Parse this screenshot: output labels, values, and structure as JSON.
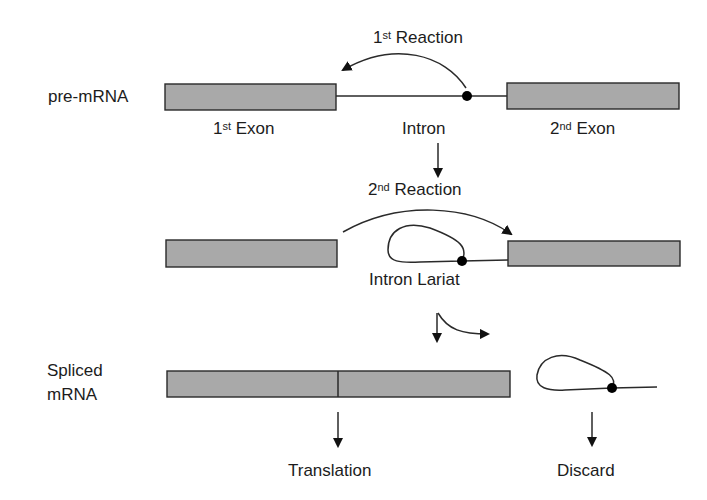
{
  "labels": {
    "pre_mrna": "pre-mRNA",
    "first_reaction": {
      "num": "1",
      "sup": "st",
      "text": " Reaction"
    },
    "first_exon": {
      "num": "1",
      "sup": "st",
      "text": " Exon"
    },
    "intron": "Intron",
    "second_exon": {
      "num": "2",
      "sup": "nd",
      "text": " Exon"
    },
    "second_reaction": {
      "num": "2",
      "sup": "nd",
      "text": " Reaction"
    },
    "intron_lariat": "Intron Lariat",
    "spliced_line1": "Spliced",
    "spliced_line2": "mRNA",
    "translation": "Translation",
    "discard": "Discard"
  },
  "colors": {
    "exon_fill": "#a9a9a9",
    "stroke": "#2a2a2a",
    "dot": "#000000"
  }
}
